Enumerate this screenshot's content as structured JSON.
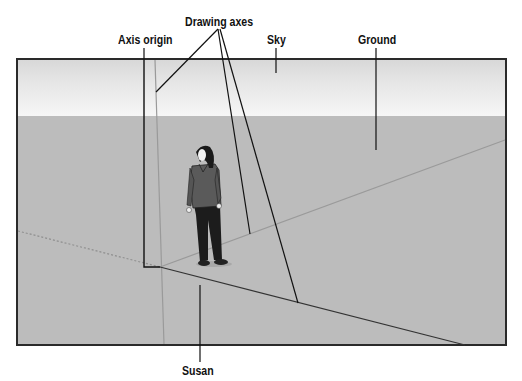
{
  "figure": {
    "labels": {
      "axis_origin": "Axis origin",
      "drawing_axes": "Drawing axes",
      "sky": "Sky",
      "ground": "Ground",
      "susan": "Susan"
    }
  },
  "colors": {
    "sky_top": "#d8d8d8",
    "sky_bottom": "#f6f6f6",
    "ground": "#bcbcbc",
    "border": "#2a2a2a",
    "leader_line": "#111111",
    "axis_line": "#8a8a8a"
  }
}
